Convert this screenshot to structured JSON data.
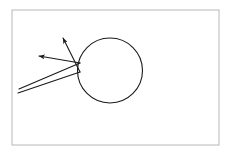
{
  "figure": {
    "canvas": {
      "width": 230,
      "height": 155,
      "background": "#ffffff"
    },
    "stroke_color": "#1a1a1a",
    "frame_color": "#b8b8b8",
    "frame": {
      "label": "figure-border",
      "x": 12,
      "y": 10,
      "width": 207,
      "height": 135,
      "stroke_width": 1,
      "fill": "none"
    },
    "circle": {
      "label": "circular-mirror",
      "cx": 110,
      "cy": 70.5,
      "r": 32.5,
      "stroke_width": 1.1,
      "fill": "none"
    },
    "incident_rays": [
      {
        "label": "incident-ray-upper",
        "from_x": 19,
        "from_y": 89,
        "to_x": 80,
        "to_y": 63
      },
      {
        "label": "incident-ray-lower",
        "from_x": 18,
        "from_y": 93,
        "to_x": 80,
        "to_y": 72
      }
    ],
    "reflected_rays": [
      {
        "label": "reflected-ray-upper",
        "from_x": 80,
        "from_y": 72,
        "to_x": 63,
        "to_y": 38,
        "arrowhead": "arrow-up-left-steep"
      },
      {
        "label": "reflected-ray-lower",
        "from_x": 80,
        "from_y": 63,
        "to_x": 39,
        "to_y": 56,
        "arrowhead": "arrow-up-left-shallow"
      }
    ],
    "arrow_marker": {
      "label": "arrowhead-marker",
      "width": 5.5,
      "height": 4.4
    }
  }
}
